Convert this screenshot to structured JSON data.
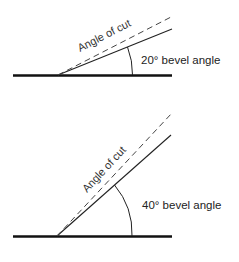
{
  "diagrams": [
    {
      "id": "top",
      "bevel_label": "20° bevel angle",
      "cut_label": "Angle of cut",
      "bevel_angle_deg": 20,
      "cut_angle_deg": 25
    },
    {
      "id": "bottom",
      "bevel_label": "40° bevel angle",
      "cut_label": "Angle of cut",
      "bevel_angle_deg": 40,
      "cut_angle_deg": 45
    }
  ],
  "colors": {
    "line": "#111111",
    "dashed": "#444444",
    "text": "#222222",
    "background": "#ffffff"
  }
}
